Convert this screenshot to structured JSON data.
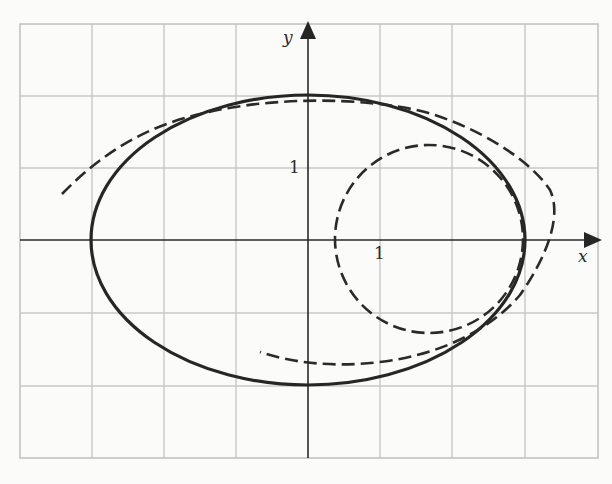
{
  "figure": {
    "title": "",
    "x_axis_label": "x",
    "y_axis_label": "y",
    "x_tick_label": "1",
    "y_tick_label": "1",
    "grid_unit_px": 72.3,
    "x_range": [
      -4,
      4
    ],
    "y_range": [
      -3,
      3
    ],
    "colors": {
      "curve": "#262626",
      "grid": "#c8c8c8",
      "background": "#fbfbfa"
    }
  },
  "curves": [
    {
      "name": "ellipse",
      "style": "solid",
      "equation": "x^2/9 + y^2/4 = 1",
      "center": [
        0,
        0
      ],
      "semi_axes": [
        3,
        2
      ]
    },
    {
      "name": "osculating-circle-at-vertex",
      "style": "dashed",
      "center": [
        1.667,
        0
      ],
      "radius": 1.333
    },
    {
      "name": "large-osculating-arc",
      "style": "dashed",
      "description": "dashed arc tangent to ellipse in upper-left and lower-right, bulging outside on upper right"
    }
  ]
}
